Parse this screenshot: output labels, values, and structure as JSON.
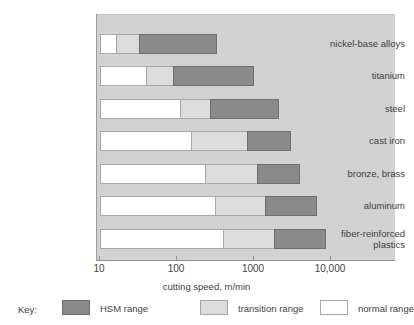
{
  "chart_data": {
    "type": "bar",
    "orientation": "horizontal",
    "stacked": true,
    "log_x": true,
    "title": "",
    "xlabel": "cutting speed, m/min",
    "ylabel": "",
    "xlim": [
      10,
      20000
    ],
    "xticks": [
      10,
      100,
      1000,
      10000
    ],
    "xticklabels": [
      "10",
      "100",
      "1000",
      "10,000"
    ],
    "grid": false,
    "legend_position": "bottom",
    "legend_title": "Key:",
    "categories": [
      "nickel-base alloys",
      "titanium",
      "steel",
      "cast iron",
      "bronze, brass",
      "aluminum",
      "fiber-reinforced plastics"
    ],
    "series": [
      {
        "name": "normal range",
        "color": "#ffffff",
        "ranges": [
          [
            10,
            16
          ],
          [
            10,
            40
          ],
          [
            10,
            110
          ],
          [
            10,
            150
          ],
          [
            10,
            230
          ],
          [
            10,
            310
          ],
          [
            10,
            400
          ]
        ]
      },
      {
        "name": "transition range",
        "color": "#dcdcdc",
        "ranges": [
          [
            16,
            32
          ],
          [
            40,
            90
          ],
          [
            110,
            270
          ],
          [
            150,
            800
          ],
          [
            230,
            1100
          ],
          [
            310,
            1400
          ],
          [
            400,
            1800
          ]
        ]
      },
      {
        "name": "HSM range",
        "color": "#8a8a8a",
        "ranges": [
          [
            32,
            330
          ],
          [
            90,
            1000
          ],
          [
            270,
            2100
          ],
          [
            800,
            3000
          ],
          [
            1100,
            4000
          ],
          [
            1400,
            6500
          ],
          [
            1800,
            8700
          ]
        ]
      }
    ],
    "bar_label_x_positions_px": {
      "axis_left_px": 99,
      "decade_px": 77
    }
  },
  "legend": {
    "title": "Key:",
    "items": [
      {
        "label": "HSM range",
        "swatch": "hsm"
      },
      {
        "label": "transition range",
        "swatch": "trans"
      },
      {
        "label": "normal range",
        "swatch": "norm"
      }
    ]
  },
  "colors": {
    "plot_background": "#d2d2d2",
    "hsm": "#8a8a8a",
    "transition": "#dcdcdc",
    "normal": "#ffffff",
    "outline": "#a8a8a8",
    "text": "#3f3f3f"
  }
}
